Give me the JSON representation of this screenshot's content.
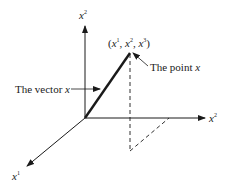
{
  "diagram": {
    "axes": {
      "vertical": {
        "name": "x",
        "index": "2"
      },
      "right": {
        "name": "x",
        "index": "2"
      },
      "diagonal": {
        "name": "x",
        "index": "1"
      }
    },
    "point": {
      "coords_prefix": "(",
      "c1": "x",
      "c1_idx": "1",
      "c2": "x",
      "c2_idx": "2",
      "c3": "x",
      "c3_idx": "3",
      "sep": ", ",
      "coords_suffix": ")"
    },
    "labels": {
      "vector_text": "The vector ",
      "vector_var": "x",
      "point_text": "The point ",
      "point_var": "x"
    }
  }
}
